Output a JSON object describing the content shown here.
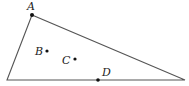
{
  "diagram": {
    "type": "geometry-triangle",
    "colors": {
      "line": "#555555",
      "point": "#111111",
      "label": "#222222",
      "background": "#ffffff"
    },
    "vertices": {
      "A": {
        "x": 32,
        "y": 15
      },
      "left": {
        "x": 7,
        "y": 80
      },
      "right": {
        "x": 185,
        "y": 80
      }
    },
    "points": [
      {
        "name": "A",
        "label": "A",
        "x": 32,
        "y": 15,
        "label_x": 27,
        "label_y": 10
      },
      {
        "name": "B",
        "label": "B",
        "x": 47,
        "y": 51,
        "label_x": 35,
        "label_y": 55
      },
      {
        "name": "C",
        "label": "C",
        "x": 75,
        "y": 59,
        "label_x": 62,
        "label_y": 64
      },
      {
        "name": "D",
        "label": "D",
        "x": 98,
        "y": 80,
        "label_x": 102,
        "label_y": 76
      }
    ]
  }
}
